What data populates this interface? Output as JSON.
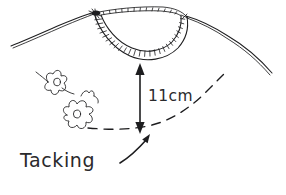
{
  "figure": {
    "kind": "hand-drawn-sketch",
    "background_color": "#ffffff",
    "ink_color": "#1d1d1f",
    "width": 286,
    "height": 195
  },
  "labels": {
    "measurement": "11cm",
    "tacking": "Tacking"
  },
  "annotations": {
    "dimension_arrow": {
      "name": "vertical-double-arrow",
      "measures": "11cm",
      "orientation": "vertical",
      "heads": "both"
    },
    "pointer_arrow": {
      "name": "tacking-pointer",
      "points_to": "tacking-dashed-line",
      "direction": "up-right"
    },
    "tacking_line": {
      "name": "tacking-stitch-line",
      "style": "dashed"
    }
  },
  "parts": {
    "neckband": "ribbed-neckline-band",
    "shoulder_left": "left-shoulder-seam-line",
    "shoulder_right": "right-shoulder-seam-line",
    "motif_left": "embroidered-flower-motif-left",
    "motif_right": "embroidered-flower-motif-right"
  }
}
